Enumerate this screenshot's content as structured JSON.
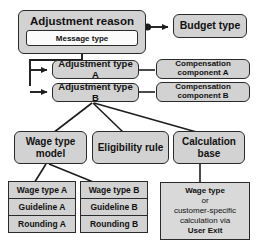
{
  "diagram": {
    "colors": {
      "node_fill": "#d2d2d2",
      "panel_fill": "#d9d9d9",
      "inner_fill": "#fbfbfb",
      "stroke": "#2a2a2a",
      "background": "#ffffff"
    },
    "nodes": {
      "adjustment_reason": "Adjustment reason",
      "message_type": "Message type",
      "budget_type": "Budget type",
      "adjustment_type_a": "Adjustment type A",
      "adjustment_type_b": "Adjustment type B",
      "compensation_component_a_line1": "Compensation",
      "compensation_component_a_line2": "component A",
      "compensation_component_b_line1": "Compensation",
      "compensation_component_b_line2": "component B",
      "wage_type_model_line1": "Wage type",
      "wage_type_model_line2": "model",
      "eligibility_rule": "Eligibility rule",
      "calculation_base_line1": "Calculation",
      "calculation_base_line2": "base"
    },
    "table_a": {
      "rows": [
        "Wage type A",
        "Guideline A",
        "Rounding A"
      ]
    },
    "table_b": {
      "rows": [
        "Wage type B",
        "Guideline B",
        "Rounding B"
      ]
    },
    "user_exit_panel": {
      "line1": "Wage type",
      "line2": "or",
      "line3": "customer-specific",
      "line4": "calculation via",
      "line5": "User Exit"
    }
  }
}
